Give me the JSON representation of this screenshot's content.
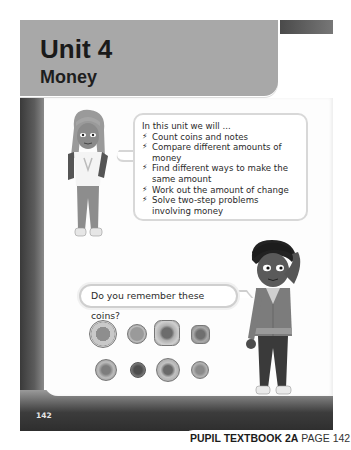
{
  "header": {
    "unit_title": "Unit 4",
    "unit_subtitle": "Money"
  },
  "intro_bubble": {
    "lead": "In this unit we will ...",
    "bullet_icon": "lightning-bolt-icon",
    "items": [
      "Count coins and notes",
      "Compare different amounts of money",
      "Find different ways to make the same amount",
      "Work out the amount of change",
      "Solve two-step problems involving money"
    ]
  },
  "question_bubble": {
    "text": "Do you remember these coins?"
  },
  "coins": [
    {
      "name": "two-pound-coin"
    },
    {
      "name": "one-pound-coin"
    },
    {
      "name": "fifty-pence-coin"
    },
    {
      "name": "twenty-pence-coin"
    },
    {
      "name": "ten-pence-coin"
    },
    {
      "name": "one-penny-coin"
    },
    {
      "name": "five-pence-coin"
    },
    {
      "name": "two-pence-coin"
    }
  ],
  "characters": [
    "girl-character",
    "boy-character"
  ],
  "page_number": "142",
  "footer": {
    "book": "PUPIL TEXTBOOK 2A",
    "page": "PAGE 142"
  },
  "colors": {
    "title_band": "#a8a8a8",
    "frame_dark": "#3a3a3a",
    "text": "#1a1a1a"
  }
}
